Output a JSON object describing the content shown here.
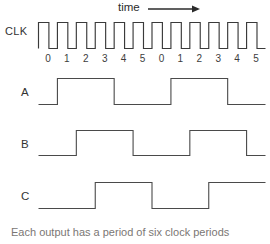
{
  "figure": {
    "title_axis_label": "time",
    "arrow_icon": "right-arrow-icon",
    "background_color": "#ffffff",
    "trace_color": "#4a4a4a"
  },
  "clock": {
    "label": "CLK",
    "pulse_count": 12,
    "description": "square wave clock, 12 pulses"
  },
  "cycle_ticks": [
    "0",
    "1",
    "2",
    "3",
    "4",
    "5",
    "0",
    "1",
    "2",
    "3",
    "4",
    "5"
  ],
  "signals": [
    {
      "label": "A",
      "period_cycles": 6,
      "high_start_cycle": 1,
      "high_end_cycle": 4,
      "levels": [
        0,
        1,
        1,
        1,
        0,
        0,
        0,
        1,
        1,
        1,
        0,
        0
      ]
    },
    {
      "label": "B",
      "period_cycles": 6,
      "high_start_cycle": 2,
      "high_end_cycle": 5,
      "levels": [
        0,
        0,
        1,
        1,
        1,
        0,
        0,
        0,
        1,
        1,
        1,
        0
      ]
    },
    {
      "label": "C",
      "period_cycles": 6,
      "high_start_cycle": 3,
      "high_end_cycle": 0,
      "levels": [
        0,
        0,
        0,
        1,
        1,
        1,
        0,
        0,
        0,
        1,
        1,
        1
      ]
    }
  ],
  "caption": {
    "text": "Each output has a period of six clock periods",
    "clipped": true
  },
  "chart_data": {
    "type": "line",
    "title": "",
    "xlabel": "time",
    "ylabel": "",
    "grid": false,
    "legend_position": "left-labels",
    "x": [
      0,
      1,
      2,
      3,
      4,
      5,
      6,
      7,
      8,
      9,
      10,
      11
    ],
    "categories": [
      "0",
      "1",
      "2",
      "3",
      "4",
      "5",
      "0",
      "1",
      "2",
      "3",
      "4",
      "5"
    ],
    "series": [
      {
        "name": "CLK",
        "values": [
          1,
          1,
          1,
          1,
          1,
          1,
          1,
          1,
          1,
          1,
          1,
          1
        ]
      },
      {
        "name": "A",
        "values": [
          0,
          1,
          1,
          1,
          0,
          0,
          0,
          1,
          1,
          1,
          0,
          0
        ]
      },
      {
        "name": "B",
        "values": [
          0,
          0,
          1,
          1,
          1,
          0,
          0,
          0,
          1,
          1,
          1,
          0
        ]
      },
      {
        "name": "C",
        "values": [
          0,
          0,
          0,
          1,
          1,
          1,
          0,
          0,
          0,
          1,
          1,
          1
        ]
      }
    ],
    "annotations": [
      "time"
    ],
    "ylim": [
      0,
      1
    ]
  }
}
